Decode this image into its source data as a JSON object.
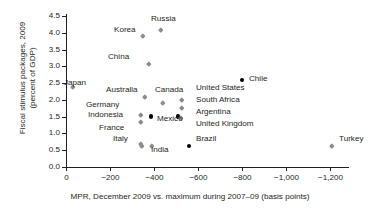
{
  "chart_data": {
    "type": "scatter",
    "title": "",
    "xlabel": "MPR, December 2009 vs. maximum during 2007–09 (basis points)",
    "ylabel": "Fiscal stimulus packages, 2009\n(percent of GDP)",
    "xlim": [
      0,
      -1200
    ],
    "ylim": [
      0.0,
      4.5
    ],
    "xticks": [
      "0",
      "−200",
      "−400",
      "−600",
      "−800",
      "−1,000",
      "−1,200"
    ],
    "xtick_values": [
      0,
      -200,
      -400,
      -600,
      -800,
      -1000,
      -1200
    ],
    "yticks": [
      "0.0",
      "0.5",
      "1.0",
      "1.5",
      "2.0",
      "2.5",
      "3.0",
      "3.5",
      "4.0",
      "4.5"
    ],
    "ytick_values": [
      0.0,
      0.5,
      1.0,
      1.5,
      2.0,
      2.5,
      3.0,
      3.5,
      4.0,
      4.5
    ],
    "grid": false,
    "legend": "none",
    "marker_colors": {
      "advanced": "#8c8c8c",
      "emerging": "#000000"
    },
    "points": [
      {
        "name": "Japan",
        "x": -30,
        "y": 2.4,
        "color": "gray",
        "lx": 64,
        "ly": 78,
        "anchor": "left"
      },
      {
        "name": "Korea",
        "x": -350,
        "y": 3.9,
        "color": "gray",
        "lx": 114,
        "ly": 25,
        "anchor": "left"
      },
      {
        "name": "Russia",
        "x": -432,
        "y": 4.1,
        "color": "gray",
        "lx": 151,
        "ly": 14,
        "anchor": "left"
      },
      {
        "name": "China",
        "x": -377,
        "y": 3.08,
        "color": "gray",
        "lx": 108,
        "ly": 52,
        "anchor": "left"
      },
      {
        "name": "Australia",
        "x": -359,
        "y": 2.08,
        "color": "gray",
        "lx": 106,
        "ly": 85,
        "anchor": "left"
      },
      {
        "name": "Canada",
        "x": -441,
        "y": 1.92,
        "color": "gray",
        "lx": 155,
        "ly": 85,
        "anchor": "left"
      },
      {
        "name": "Germany",
        "x": -341,
        "y": 1.56,
        "color": "gray",
        "lx": 86,
        "ly": 100,
        "anchor": "left"
      },
      {
        "name": "Indonesia",
        "x": -341,
        "y": 1.35,
        "color": "gray",
        "lx": 88,
        "ly": 110,
        "anchor": "left"
      },
      {
        "name": "France",
        "x": -341,
        "y": 0.7,
        "color": "gray",
        "lx": 99,
        "ly": 123,
        "anchor": "left"
      },
      {
        "name": "Italy",
        "x": -345,
        "y": 0.62,
        "color": "gray",
        "lx": 113,
        "ly": 134,
        "anchor": "left"
      },
      {
        "name": "Mexico",
        "x": -386,
        "y": 1.5,
        "color": "black",
        "lx": 157,
        "ly": 114,
        "anchor": "left"
      },
      {
        "name": "India",
        "x": -391,
        "y": 0.62,
        "color": "gray",
        "lx": 151,
        "ly": 145,
        "anchor": "left"
      },
      {
        "name": "United States",
        "x": -527,
        "y": 2.0,
        "color": "gray",
        "lx": 196,
        "ly": 83,
        "anchor": "left"
      },
      {
        "name": "South Africa",
        "x": -527,
        "y": 1.77,
        "color": "gray",
        "lx": 196,
        "ly": 95,
        "anchor": "left"
      },
      {
        "name": "Argentina",
        "x": -509,
        "y": 1.5,
        "color": "black",
        "lx": 196,
        "ly": 107,
        "anchor": "left"
      },
      {
        "name": "United Kingdom",
        "x": -523,
        "y": 1.46,
        "color": "gray",
        "lx": 196,
        "ly": 119,
        "anchor": "left"
      },
      {
        "name": "Brazil",
        "x": -559,
        "y": 0.62,
        "color": "black",
        "lx": 196,
        "ly": 134,
        "anchor": "left"
      },
      {
        "name": "Chile",
        "x": -800,
        "y": 2.6,
        "color": "black",
        "lx": 249,
        "ly": 74,
        "anchor": "left"
      },
      {
        "name": "Turkey",
        "x": -1209,
        "y": 0.62,
        "color": "gray",
        "lx": 339,
        "ly": 134,
        "anchor": "left"
      }
    ]
  }
}
